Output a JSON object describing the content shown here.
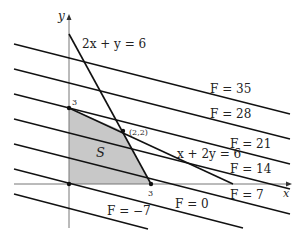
{
  "axes": {
    "x_label": "x",
    "y_label": "y",
    "x_tick": "3",
    "y_tick": "3"
  },
  "region": {
    "label": "S",
    "fill": "#c8c8c8",
    "vertices": [
      [
        0,
        0
      ],
      [
        3,
        0
      ],
      [
        2,
        2
      ],
      [
        0,
        3
      ]
    ]
  },
  "constraints": [
    {
      "label": "2x + y = 6"
    },
    {
      "label": "x + 2y = 6"
    }
  ],
  "vertex_label": "(2,2)",
  "level_lines": [
    {
      "label": "F = 35"
    },
    {
      "label": "F = 28"
    },
    {
      "label": "F = 21"
    },
    {
      "label": "F = 14"
    },
    {
      "label": "F = 7"
    },
    {
      "label": "F = 0"
    },
    {
      "label": "F = −7"
    }
  ]
}
